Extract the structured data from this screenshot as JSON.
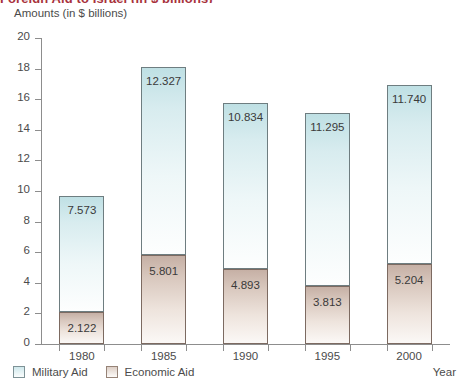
{
  "title_clipped": "Foreign Aid to Israel (in $ billions)",
  "axis": {
    "y_caption": "Amounts (in $ billions)",
    "x_caption": "Year"
  },
  "legend": {
    "items": [
      {
        "label": "Military Aid",
        "swatch": "military-aid-swatch",
        "color": "#cfe8ec"
      },
      {
        "label": "Economic Aid",
        "swatch": "economic-aid-swatch",
        "color": "#ddcfc6"
      }
    ]
  },
  "chart_data": {
    "type": "bar",
    "stacked": true,
    "title": "Foreign Aid to Israel (in $ billions)",
    "xlabel": "Year",
    "ylabel": "Amounts (in $ billions)",
    "categories": [
      "1980",
      "1985",
      "1990",
      "1995",
      "2000"
    ],
    "ylim": [
      0,
      20
    ],
    "ytick_labels": [
      "0",
      "2",
      "4",
      "6",
      "8",
      "10",
      "12",
      "14",
      "16",
      "18",
      "20"
    ],
    "ytick_values": [
      0,
      2,
      4,
      6,
      8,
      10,
      12,
      14,
      16,
      18,
      20
    ],
    "grid": false,
    "legend_position": "bottom-left",
    "series": [
      {
        "name": "Economic Aid",
        "stack_order": 0,
        "color": "#ddcfc6",
        "values": [
          2.122,
          5.801,
          4.893,
          3.813,
          5.204
        ],
        "labels": [
          "2.122",
          "5.801",
          "4.893",
          "3.813",
          "5.204"
        ]
      },
      {
        "name": "Military Aid",
        "stack_order": 1,
        "color": "#cfe8ec",
        "values": [
          7.573,
          12.327,
          10.834,
          11.295,
          11.74
        ],
        "labels": [
          "7.573",
          "12.327",
          "10.834",
          "11.295",
          "11.740"
        ]
      }
    ],
    "totals": [
      9.695,
      18.128,
      15.727,
      15.108,
      16.944
    ]
  }
}
